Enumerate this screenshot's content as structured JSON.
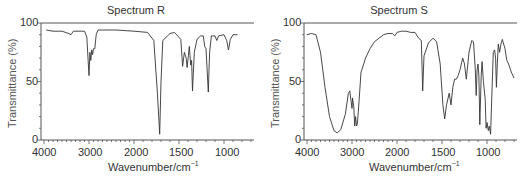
{
  "chart_data": [
    {
      "type": "line",
      "title": "Spectrum R",
      "xlabel": "Wavenumber/cm⁻¹",
      "ylabel": "Transmittance (%)",
      "x_tick_labels": [
        "4000",
        "3000",
        "2000",
        "1500",
        "1000"
      ],
      "y_tick_labels": [
        "0",
        "50",
        "100"
      ],
      "xlim": [
        4000,
        700
      ],
      "ylim": [
        0,
        100
      ],
      "x_scale_note": "scale changes at 2000 cm-1 (2x expanded below 2000)",
      "grid": false,
      "series": [
        {
          "name": "Spectrum R",
          "points": [
            [
              3950,
              94
            ],
            [
              3800,
              93
            ],
            [
              3600,
              93
            ],
            [
              3450,
              91
            ],
            [
              3400,
              90
            ],
            [
              3350,
              93
            ],
            [
              3100,
              93
            ],
            [
              3050,
              88
            ],
            [
              3000,
              55
            ],
            [
              2980,
              75
            ],
            [
              2960,
              68
            ],
            [
              2940,
              77
            ],
            [
              2920,
              73
            ],
            [
              2900,
              78
            ],
            [
              2870,
              78
            ],
            [
              2840,
              90
            ],
            [
              2800,
              94
            ],
            [
              2400,
              94
            ],
            [
              2000,
              93
            ],
            [
              1850,
              92
            ],
            [
              1780,
              85
            ],
            [
              1740,
              40
            ],
            [
              1715,
              5
            ],
            [
              1700,
              50
            ],
            [
              1680,
              85
            ],
            [
              1600,
              91
            ],
            [
              1550,
              92
            ],
            [
              1480,
              86
            ],
            [
              1460,
              63
            ],
            [
              1440,
              75
            ],
            [
              1420,
              70
            ],
            [
              1410,
              62
            ],
            [
              1395,
              72
            ],
            [
              1385,
              80
            ],
            [
              1370,
              64
            ],
            [
              1360,
              68
            ],
            [
              1350,
              42
            ],
            [
              1330,
              75
            ],
            [
              1300,
              86
            ],
            [
              1260,
              89
            ],
            [
              1230,
              89
            ],
            [
              1215,
              80
            ],
            [
              1200,
              78
            ],
            [
              1175,
              41
            ],
            [
              1160,
              75
            ],
            [
              1140,
              89
            ],
            [
              1100,
              89
            ],
            [
              1080,
              85
            ],
            [
              1060,
              89
            ],
            [
              1000,
              90
            ],
            [
              970,
              85
            ],
            [
              950,
              77
            ],
            [
              930,
              86
            ],
            [
              900,
              90
            ],
            [
              850,
              90
            ]
          ]
        }
      ]
    },
    {
      "type": "line",
      "title": "Spectrum S",
      "xlabel": "Wavenumber/cm⁻¹",
      "ylabel": "Transmittance (%)",
      "x_tick_labels": [
        "4000",
        "3000",
        "2000",
        "1500",
        "1000"
      ],
      "y_tick_labels": [
        "0",
        "50",
        "100"
      ],
      "xlim": [
        4000,
        700
      ],
      "ylim": [
        0,
        100
      ],
      "x_scale_note": "scale changes at 2000 cm-1 (2x expanded below 2000)",
      "grid": false,
      "series": [
        {
          "name": "Spectrum S",
          "points": [
            [
              4000,
              90
            ],
            [
              3900,
              91
            ],
            [
              3800,
              90
            ],
            [
              3700,
              75
            ],
            [
              3600,
              45
            ],
            [
              3500,
              20
            ],
            [
              3400,
              8
            ],
            [
              3330,
              6
            ],
            [
              3250,
              9
            ],
            [
              3150,
              22
            ],
            [
              3080,
              40
            ],
            [
              3050,
              42
            ],
            [
              3020,
              33
            ],
            [
              3000,
              27
            ],
            [
              2990,
              36
            ],
            [
              2960,
              28
            ],
            [
              2940,
              12
            ],
            [
              2920,
              20
            ],
            [
              2900,
              12
            ],
            [
              2880,
              14
            ],
            [
              2850,
              30
            ],
            [
              2800,
              58
            ],
            [
              2780,
              60
            ],
            [
              2700,
              70
            ],
            [
              2600,
              78
            ],
            [
              2500,
              84
            ],
            [
              2400,
              87
            ],
            [
              2300,
              90
            ],
            [
              2200,
              91
            ],
            [
              2100,
              91
            ],
            [
              2050,
              89
            ],
            [
              2000,
              92
            ],
            [
              1950,
              93
            ],
            [
              1900,
              93
            ],
            [
              1850,
              92
            ],
            [
              1800,
              92
            ],
            [
              1760,
              87
            ],
            [
              1730,
              85
            ],
            [
              1715,
              42
            ],
            [
              1700,
              72
            ],
            [
              1650,
              83
            ],
            [
              1600,
              87
            ],
            [
              1560,
              84
            ],
            [
              1520,
              65
            ],
            [
              1490,
              30
            ],
            [
              1470,
              18
            ],
            [
              1450,
              30
            ],
            [
              1420,
              40
            ],
            [
              1400,
              30
            ],
            [
              1380,
              45
            ],
            [
              1360,
              52
            ],
            [
              1340,
              52
            ],
            [
              1320,
              55
            ],
            [
              1300,
              60
            ],
            [
              1270,
              70
            ],
            [
              1250,
              65
            ],
            [
              1230,
              52
            ],
            [
              1200,
              75
            ],
            [
              1170,
              85
            ],
            [
              1150,
              84
            ],
            [
              1130,
              60
            ],
            [
              1120,
              38
            ],
            [
              1110,
              60
            ],
            [
              1100,
              65
            ],
            [
              1090,
              55
            ],
            [
              1080,
              13
            ],
            [
              1065,
              55
            ],
            [
              1055,
              67
            ],
            [
              1040,
              50
            ],
            [
              1020,
              35
            ],
            [
              1010,
              10
            ],
            [
              1000,
              15
            ],
            [
              985,
              8
            ],
            [
              975,
              12
            ],
            [
              960,
              5
            ],
            [
              945,
              40
            ],
            [
              930,
              75
            ],
            [
              915,
              77
            ],
            [
              905,
              70
            ],
            [
              895,
              45
            ],
            [
              885,
              65
            ],
            [
              875,
              82
            ],
            [
              860,
              75
            ],
            [
              845,
              82
            ],
            [
              830,
              86
            ],
            [
              800,
              78
            ],
            [
              780,
              68
            ],
            [
              760,
              65
            ],
            [
              730,
              58
            ],
            [
              700,
              53
            ]
          ]
        }
      ]
    }
  ],
  "panels": [
    {
      "title": "Spectrum R",
      "ylabel": "Transmittance (%)",
      "xlabel": "Wavenumber/cm",
      "xlabel_sup": "−1",
      "x_ticks": [
        "4000",
        "3000",
        "2000",
        "1500",
        "1000"
      ],
      "y_ticks": [
        "100",
        "50",
        "0"
      ]
    },
    {
      "title": "Spectrum S",
      "ylabel": "Transmittance (%)",
      "xlabel": "Wavenumber/cm",
      "xlabel_sup": "−1",
      "x_ticks": [
        "4000",
        "3000",
        "2000",
        "1500",
        "1000"
      ],
      "y_ticks": [
        "100",
        "50",
        "0"
      ]
    }
  ],
  "colors": {
    "line": "#333333",
    "axis": "#555555",
    "text": "#333333"
  }
}
